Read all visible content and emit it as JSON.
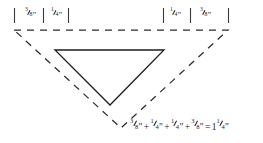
{
  "figure": {
    "background_color": "#ffffff",
    "stroke_color": "#2b2b2b",
    "solid_stroke_color": "#1c1c1c",
    "width": 263,
    "height": 143
  },
  "ruler": {
    "tick_color": "#3a3a3a",
    "segments": [
      {
        "label_whole": "",
        "label_num": "3",
        "label_den": "8",
        "unit": "\"",
        "side": "left",
        "text": "3/8\""
      },
      {
        "label_whole": "",
        "label_num": "1",
        "label_den": "4",
        "unit": "\"",
        "side": "left",
        "text": "1/4\""
      },
      {
        "label_whole": "",
        "label_num": "1",
        "label_den": "4",
        "unit": "\"",
        "side": "right",
        "text": "1/4\""
      },
      {
        "label_whole": "",
        "label_num": "3",
        "label_den": "8",
        "unit": "\"",
        "side": "right",
        "text": "3/8\""
      }
    ]
  },
  "equation": {
    "terms": [
      {
        "num": "3",
        "den": "8",
        "unit": "\""
      },
      {
        "num": "1",
        "den": "4",
        "unit": "\""
      },
      {
        "num": "1",
        "den": "4",
        "unit": "\""
      },
      {
        "num": "3",
        "den": "8",
        "unit": "\""
      }
    ],
    "plus": "+",
    "equals": "=",
    "result": {
      "whole": "1",
      "num": "1",
      "den": "4",
      "unit": "\""
    },
    "plain_text": "3/8\" + 1/4\" + 1/4\" + 3/8\" = 1 1/4\""
  },
  "shapes": {
    "outer_triangle": {
      "name": "dashed-outer-triangle",
      "style": "dashed",
      "points": "14,30 228,30 121,128"
    },
    "inner_triangle": {
      "name": "solid-inner-triangle",
      "style": "solid",
      "points": "55,50 164,50 110,105"
    }
  }
}
